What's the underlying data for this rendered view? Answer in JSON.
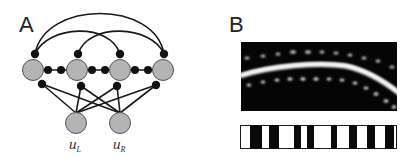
{
  "panels": {
    "a": {
      "label": "A",
      "input_nodes": [
        {
          "id": "uL",
          "label_main": "u",
          "label_sub": "L"
        },
        {
          "id": "uR",
          "label_main": "u",
          "label_sub": "R"
        }
      ],
      "ring_node_count": 4
    },
    "b": {
      "label": "B",
      "barcode_stripes": 8
    }
  },
  "colors": {
    "node_fill": "#b4b4b4",
    "node_stroke": "#555555",
    "synapse": "#111111",
    "edge": "#1a1a1a",
    "image_bg": "#050505"
  }
}
